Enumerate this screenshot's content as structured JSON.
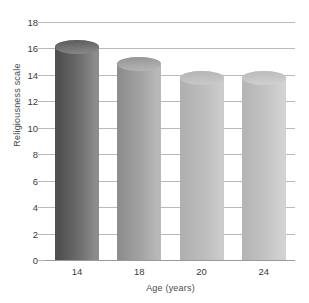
{
  "chart_data": {
    "type": "bar",
    "title": "",
    "subtitle": "",
    "xlabel": "Age (years)",
    "ylabel": "Religiousness scale",
    "categories": [
      "14",
      "18",
      "20",
      "24"
    ],
    "values": [
      16.1,
      14.8,
      13.8,
      13.8
    ],
    "series": [
      {
        "name": "Religiousness scale",
        "values": [
          16.1,
          14.8,
          13.8,
          13.8
        ]
      }
    ],
    "ylim": [
      0,
      18
    ],
    "ytick_labels": [
      "18",
      "16",
      "14",
      "12",
      "10",
      "8",
      "6",
      "4",
      "2",
      "0"
    ],
    "ytick_values": [
      18,
      16,
      14,
      12,
      10,
      8,
      6,
      4,
      2,
      0
    ],
    "ytick_step": 2,
    "xtick_labels": [
      "14",
      "18",
      "20",
      "24"
    ],
    "grid": true,
    "grid_axis": "y",
    "legend": false,
    "legend_position": "none",
    "bar_style": "cylinder-3d",
    "annotations": [],
    "colors": {
      "background": "#ffffff",
      "gridline": "#b9b9b9",
      "axis": "#9a9a9a",
      "tick_text": "#3b3b3b",
      "axis_title_text": "#4a4a4a",
      "bars": [
        {
          "dark": "#4f4f4f",
          "mid": "#6d6d6d",
          "light": "#8c8c8c",
          "cap": "#5a5a5a"
        },
        {
          "dark": "#8e8e8e",
          "mid": "#a3a3a3",
          "light": "#b8b8b8",
          "cap": "#949494"
        },
        {
          "dark": "#b0b0b0",
          "mid": "#bdbdbd",
          "light": "#cbcbcb",
          "cap": "#b4b4b4"
        },
        {
          "dark": "#b6b6b6",
          "mid": "#c3c3c3",
          "light": "#d2d2d2",
          "cap": "#bababa"
        }
      ]
    }
  }
}
